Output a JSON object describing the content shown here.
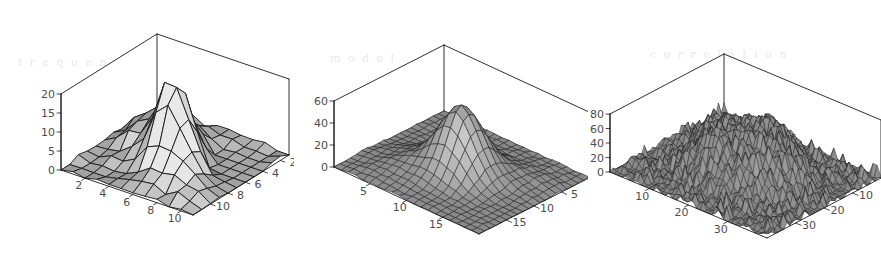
{
  "figure": {
    "background_color": "#ffffff",
    "panel_count": 3,
    "ghost_artifacts": [
      {
        "text": "f  r  e  q  u  e  n  c  y    s  p  e",
        "x": 18,
        "y": 56
      },
      {
        "text": "m  o  d  e  l",
        "x": 330,
        "y": 52
      },
      {
        "text": "c  o  r  r  e  l  a  t  i  o  n",
        "x": 650,
        "y": 48
      },
      {
        "text": "t  e  x",
        "x": 440,
        "y": 206
      },
      {
        "text": "s  p  e  c  t  r  u  m",
        "x": 660,
        "y": 86
      }
    ]
  },
  "chart_data": [
    {
      "type": "surface",
      "panel_index": 0,
      "title": "",
      "xlabel": "",
      "ylabel": "",
      "zlabel": "",
      "grid": true,
      "legend": "none",
      "mesh_nx": 11,
      "mesh_ny": 11,
      "surface_shade": "gray-gouraud",
      "description": "Coarse 11x11 mesh surface with a single sharp ridge/peak near the centre rising to about 20, falling away to 0 at the corners; mild low-frequency roughness.",
      "xaxis": {
        "label": "",
        "ticks": [
          2,
          4,
          6,
          8,
          10
        ],
        "tick_labels": [
          "2",
          "4",
          "6",
          "8",
          "10"
        ],
        "range": [
          0,
          11
        ]
      },
      "yaxis": {
        "label": "",
        "ticks": [
          2,
          4,
          6,
          8,
          10
        ],
        "tick_labels": [
          "10",
          "8",
          "6",
          "4",
          "2"
        ],
        "range": [
          0,
          11
        ]
      },
      "zaxis": {
        "label": "",
        "ticks": [
          0,
          5,
          10,
          15,
          20
        ],
        "tick_labels": [
          "20",
          "15",
          "10",
          "5",
          "0"
        ],
        "range": [
          0,
          20
        ],
        "zlim": [
          0,
          20
        ]
      },
      "peak_value": 20,
      "base_value": 0
    },
    {
      "type": "surface",
      "panel_index": 1,
      "title": "",
      "xlabel": "",
      "ylabel": "",
      "zlabel": "",
      "grid": true,
      "legend": "none",
      "mesh_nx": 20,
      "mesh_ny": 20,
      "surface_shade": "gray-gouraud",
      "description": "Medium 20x20 mesh surface showing a smooth broad Gaussian-like bump centred in the domain peaking near 60, decaying smoothly to a flat base near 0.",
      "xaxis": {
        "label": "",
        "ticks": [
          5,
          10,
          15
        ],
        "tick_labels": [
          "5",
          "10",
          "15"
        ],
        "range": [
          0,
          20
        ]
      },
      "yaxis": {
        "label": "",
        "ticks": [
          5,
          10,
          15
        ],
        "tick_labels": [
          "15",
          "10",
          "5"
        ],
        "range": [
          0,
          20
        ]
      },
      "zaxis": {
        "label": "",
        "ticks": [
          0,
          20,
          40,
          60
        ],
        "tick_labels": [
          "60",
          "40",
          "20",
          "0"
        ],
        "range": [
          0,
          60
        ],
        "zlim": [
          0,
          60
        ]
      },
      "peak_value": 60,
      "base_value": 0
    },
    {
      "type": "surface",
      "panel_index": 2,
      "title": "",
      "xlabel": "",
      "ylabel": "",
      "zlabel": "",
      "grid": true,
      "legend": "none",
      "mesh_nx": 40,
      "mesh_ny": 40,
      "surface_shade": "gray-gouraud",
      "description": "Dense 40x40 mesh surface forming a rough, highly noisy mesa/plateau that rises steeply to roughly 80 over the central region, with jagged high-frequency fluctuations everywhere and a low noisy floor around the edges.",
      "xaxis": {
        "label": "",
        "ticks": [
          10,
          20,
          30
        ],
        "tick_labels": [
          "10",
          "20",
          "30"
        ],
        "range": [
          0,
          40
        ]
      },
      "yaxis": {
        "label": "",
        "ticks": [
          10,
          20,
          30
        ],
        "tick_labels": [
          "30",
          "20",
          "10"
        ],
        "range": [
          0,
          40
        ]
      },
      "zaxis": {
        "label": "",
        "ticks": [
          0,
          20,
          40,
          60,
          80
        ],
        "tick_labels": [
          "80",
          "60",
          "40",
          "20",
          "0"
        ],
        "range": [
          0,
          80
        ],
        "zlim": [
          0,
          80
        ]
      },
      "peak_value": 80,
      "base_value": 0
    }
  ],
  "colors": {
    "background": "#ffffff",
    "axis_line": "#1a1a1a",
    "tick_label": "#4d4d4d",
    "mesh_line": "#202020",
    "surface_light": "#e0e0e0",
    "surface_mid": "#b4b4b4",
    "surface_dark": "#7a7a7a",
    "ghost_text": "#e9e9e9"
  }
}
